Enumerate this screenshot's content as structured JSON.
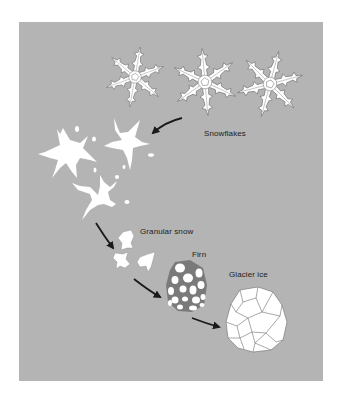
{
  "colors": {
    "background": "#ffffff",
    "panel": "#b4b4b4",
    "ice_fill": "#ffffff",
    "outline": "#6e6e6e",
    "arrow": "#1a1a1a",
    "text": "#1c1c1c"
  },
  "stages": [
    {
      "id": "snowflakes",
      "label": "Snowflakes"
    },
    {
      "id": "granular",
      "label": "Granular snow"
    },
    {
      "id": "firn",
      "label": "Firn"
    },
    {
      "id": "glacier",
      "label": "Glacier ice"
    }
  ]
}
